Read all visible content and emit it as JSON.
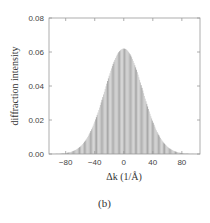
{
  "chart_data": {
    "type": "bar",
    "title": "",
    "xlabel": "Δk (1/Å)",
    "ylabel": "diffraction intensity",
    "xlim": [
      -103,
      105
    ],
    "ylim": [
      0,
      0.08
    ],
    "x_ticks": [
      -80,
      -40,
      0,
      40,
      80
    ],
    "y_ticks": [
      0.0,
      0.02,
      0.04,
      0.06,
      0.08
    ],
    "y_tick_labels": [
      "0.00",
      "0.02",
      "0.04",
      "0.06",
      "0.08"
    ],
    "grid": false,
    "series": [
      {
        "name": "diffraction intensity",
        "shape": "gaussian",
        "center": 0,
        "peak": 0.062,
        "sigma": 26,
        "color": "#9a9a9a"
      }
    ]
  },
  "caption": "(b)"
}
